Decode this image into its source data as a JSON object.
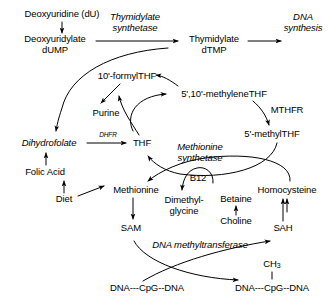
{
  "diagram": {
    "background_color": "#ffffff",
    "ink_color": "#000000",
    "width": 335,
    "height": 300,
    "nodes": [
      {
        "id": "deoxyuridine",
        "label": "Deoxyuridine (dU)",
        "x": 62,
        "y": 14,
        "style": "plain"
      },
      {
        "id": "dump",
        "label": "Deoxyuridylate\ndUMP",
        "x": 55,
        "y": 44,
        "style": "plain"
      },
      {
        "id": "thymidylate_synthetase",
        "label": "Thymidylate\nsynthetase",
        "x": 135,
        "y": 22,
        "style": "italic"
      },
      {
        "id": "dtmp",
        "label": "Thymidylate\ndTMP",
        "x": 214,
        "y": 44,
        "style": "plain"
      },
      {
        "id": "dna_synthesis",
        "label": "DNA\nsynthesis",
        "x": 303,
        "y": 22,
        "style": "italic"
      },
      {
        "id": "formylthf",
        "label": "10'-formylTHF",
        "x": 127,
        "y": 76,
        "style": "plain"
      },
      {
        "id": "methylenethf",
        "label": "5',10'-methyleneTHF",
        "x": 224,
        "y": 94,
        "style": "plain"
      },
      {
        "id": "purine",
        "label": "Purine",
        "x": 106,
        "y": 113,
        "style": "plain"
      },
      {
        "id": "mthfr",
        "label": "MTHFR",
        "x": 287,
        "y": 110,
        "style": "plain"
      },
      {
        "id": "dihydrofolate",
        "label": "Dihydrofolate",
        "x": 49,
        "y": 143,
        "style": "italic"
      },
      {
        "id": "dhfr",
        "label": "DHFR",
        "x": 110,
        "y": 136,
        "style": "italic-small"
      },
      {
        "id": "thf",
        "label": "THF",
        "x": 142,
        "y": 143,
        "style": "plain"
      },
      {
        "id": "methylthf",
        "label": "5'-methylTHF",
        "x": 272,
        "y": 134,
        "style": "plain"
      },
      {
        "id": "methionine_synthetase",
        "label": "Methionine\nsynthetase",
        "x": 200,
        "y": 152,
        "style": "italic"
      },
      {
        "id": "folic_acid",
        "label": "Folic Acid",
        "x": 45,
        "y": 172,
        "style": "plain"
      },
      {
        "id": "b12",
        "label": "B12",
        "x": 198,
        "y": 178,
        "style": "plain"
      },
      {
        "id": "methionine",
        "label": "Methionine",
        "x": 136,
        "y": 190,
        "style": "plain"
      },
      {
        "id": "homocysteine",
        "label": "Homocysteine",
        "x": 287,
        "y": 190,
        "style": "plain"
      },
      {
        "id": "diet",
        "label": "Diet",
        "x": 64,
        "y": 199,
        "style": "plain"
      },
      {
        "id": "betaine",
        "label": "Betaine",
        "x": 236,
        "y": 199,
        "style": "plain"
      },
      {
        "id": "dimethylglycine",
        "label": "Dimethyl-\nglycine",
        "x": 184,
        "y": 205,
        "style": "plain"
      },
      {
        "id": "choline",
        "label": "Choline",
        "x": 236,
        "y": 221,
        "style": "plain"
      },
      {
        "id": "sam",
        "label": "SAM",
        "x": 131,
        "y": 228,
        "style": "plain"
      },
      {
        "id": "sah",
        "label": "SAH",
        "x": 283,
        "y": 228,
        "style": "plain"
      },
      {
        "id": "dna_methyltransferase",
        "label": "DNA methyltransferase",
        "x": 200,
        "y": 245,
        "style": "italic"
      },
      {
        "id": "ch3",
        "label": "CH3",
        "x": 272,
        "y": 265,
        "style": "subscript"
      },
      {
        "id": "dna_cpg_left",
        "label": "DNA---CpG--DNA",
        "x": 147,
        "y": 288,
        "style": "plain"
      },
      {
        "id": "dna_cpg_right",
        "label": "DNA---CpG--DNA",
        "x": 272,
        "y": 288,
        "style": "plain"
      }
    ],
    "edges": [
      {
        "id": "e-du-dump",
        "from": "deoxyuridine",
        "to": "dump",
        "kind": "straight"
      },
      {
        "id": "e-dump-dtmp",
        "from": "dump",
        "to": "dtmp",
        "kind": "straight",
        "enzyme": "thymidylate_synthetase"
      },
      {
        "id": "e-dtmp-dna",
        "from": "dtmp",
        "to": "dna_synthesis",
        "kind": "straight"
      },
      {
        "id": "e-dump-dhf",
        "from": "dump",
        "to": "dihydrofolate",
        "kind": "curved"
      },
      {
        "id": "e-formyl-purine",
        "from": "formylthf",
        "to": "purine",
        "kind": "straight"
      },
      {
        "id": "e-thf-formyl",
        "from": "thf",
        "to": "formylthf",
        "kind": "curved"
      },
      {
        "id": "e-thf-methylene",
        "from": "thf",
        "to": "methylenethf",
        "kind": "curved"
      },
      {
        "id": "e-methylene-formyl",
        "from": "methylenethf",
        "to": "formylthf",
        "kind": "curved"
      },
      {
        "id": "e-methylene-methyl",
        "from": "methylenethf",
        "to": "methylthf",
        "kind": "curved",
        "enzyme": "mthfr"
      },
      {
        "id": "e-dhf-thf",
        "from": "dihydrofolate",
        "to": "thf",
        "kind": "straight",
        "enzyme": "dhfr"
      },
      {
        "id": "e-folic-dhf",
        "from": "folic_acid",
        "to": "dihydrofolate",
        "kind": "straight"
      },
      {
        "id": "e-diet-folic",
        "from": "diet",
        "to": "folic_acid",
        "kind": "straight"
      },
      {
        "id": "e-diet-met",
        "from": "diet",
        "to": "methionine",
        "kind": "straight"
      },
      {
        "id": "e-methyl-thf",
        "from": "methylthf",
        "to": "thf",
        "kind": "curved",
        "enzyme": "methionine_synthetase"
      },
      {
        "id": "e-hcy-met",
        "from": "homocysteine",
        "to": "methionine",
        "kind": "curved",
        "enzyme": "methionine_synthetase"
      },
      {
        "id": "e-b12-dmg",
        "from": "b12",
        "to": "dimethylglycine",
        "kind": "curved"
      },
      {
        "id": "e-betaine-hcy",
        "from": "betaine",
        "to": "homocysteine",
        "kind": "straight"
      },
      {
        "id": "e-choline-betaine",
        "from": "choline",
        "to": "betaine",
        "kind": "straight"
      },
      {
        "id": "e-met-sam",
        "from": "methionine",
        "to": "sam",
        "kind": "straight"
      },
      {
        "id": "e-sah-hcy",
        "from": "sah",
        "to": "homocysteine",
        "kind": "straight"
      },
      {
        "id": "e-sam-dna",
        "from": "sam",
        "to": "dna_cpg_right",
        "kind": "curved",
        "enzyme": "dna_methyltransferase"
      },
      {
        "id": "e-dna-sah",
        "from": "dna_cpg_left",
        "to": "sah",
        "kind": "curved",
        "enzyme": "dna_methyltransferase"
      },
      {
        "id": "e-ch3-cpg",
        "from": "ch3",
        "to": "dna_cpg_right",
        "kind": "bond"
      }
    ]
  }
}
